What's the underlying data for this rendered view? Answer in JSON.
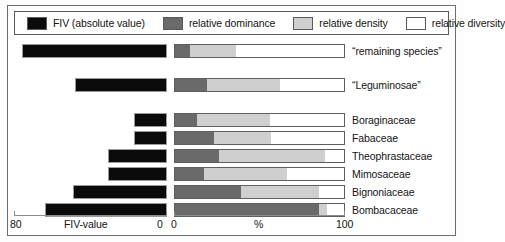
{
  "chart_data": {
    "type": "bar",
    "title": "",
    "subtitle": "",
    "orientation": "horizontal",
    "panels": [
      {
        "name": "fiv-panel",
        "xlabel": "FIV-value",
        "xlim": [
          80,
          0
        ],
        "reversed": true,
        "ticks": [
          "80",
          "0"
        ],
        "tick_values": [
          80,
          0
        ]
      },
      {
        "name": "percent-panel",
        "xlabel": "%",
        "xlim": [
          0,
          100
        ],
        "reversed": false,
        "ticks": [
          "0",
          "100"
        ],
        "tick_values": [
          0,
          100
        ],
        "stacked": true
      }
    ],
    "categories": [
      "“remaining species”",
      "“Leguminosae”",
      "Boraginaceae",
      "Fabaceae",
      "Theophrastaceae",
      "Mimosaceae",
      "Bignoniaceae",
      "Bombacaceae"
    ],
    "series": [
      {
        "name": "FIV (absolute value)",
        "color": "#0b0b0b",
        "unit": "FIV",
        "values": [
          76,
          48,
          17,
          17,
          31,
          31,
          49,
          64
        ]
      },
      {
        "name": "relative dominance",
        "color": "#6a6a6a",
        "unit": "%",
        "values": [
          9,
          19,
          13,
          23,
          26,
          17,
          39,
          85
        ]
      },
      {
        "name": "relative density",
        "color": "#cfcfcf",
        "unit": "%",
        "values": [
          27,
          43,
          43,
          34,
          63,
          49,
          46,
          5
        ]
      },
      {
        "name": "relative diversity",
        "color": "#ffffff",
        "unit": "%",
        "values": [
          64,
          38,
          44,
          43,
          11,
          34,
          15,
          10
        ]
      }
    ],
    "grid": false,
    "legend_position": "top"
  },
  "legend": {
    "items": [
      {
        "label": "FIV (absolute value)",
        "color": "#0b0b0b"
      },
      {
        "label": "relative dominance",
        "color": "#6a6a6a"
      },
      {
        "label": "relative density",
        "color": "#cfcfcf"
      },
      {
        "label": "relative diversity",
        "color": "#ffffff"
      }
    ]
  },
  "axes": {
    "left": {
      "max_label": "80",
      "min_label": "0",
      "title": "FIV-value"
    },
    "right": {
      "min_label": "0",
      "title": "%",
      "max_label": "100"
    }
  },
  "rows": [
    {
      "label": "“remaining species”",
      "fiv": 76,
      "dominance": 9,
      "density": 27,
      "diversity": 64
    },
    {
      "label": "“Leguminosae”",
      "fiv": 48,
      "dominance": 19,
      "density": 43,
      "diversity": 38
    },
    {
      "label": "Boraginaceae",
      "fiv": 17,
      "dominance": 13,
      "density": 43,
      "diversity": 44
    },
    {
      "label": "Fabaceae",
      "fiv": 17,
      "dominance": 23,
      "density": 34,
      "diversity": 43
    },
    {
      "label": "Theophrastaceae",
      "fiv": 31,
      "dominance": 26,
      "density": 63,
      "diversity": 11
    },
    {
      "label": "Mimosaceae",
      "fiv": 31,
      "dominance": 17,
      "density": 49,
      "diversity": 34
    },
    {
      "label": "Bignoniaceae",
      "fiv": 49,
      "dominance": 39,
      "density": 46,
      "diversity": 15
    },
    {
      "label": "Bombacaceae",
      "fiv": 64,
      "dominance": 85,
      "density": 5,
      "diversity": 10
    }
  ]
}
